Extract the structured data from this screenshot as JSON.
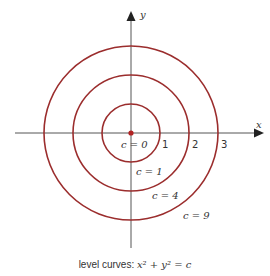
{
  "diagram": {
    "title": "level curves",
    "center": {
      "x": 131,
      "y": 133
    },
    "colors": {
      "curve": "#9b2d2d",
      "axis": "#555555",
      "text": "#333333",
      "origin_dot": "#b22222"
    },
    "axes": {
      "x_label": "x",
      "y_label": "y"
    },
    "tick_labels": [
      "1",
      "2",
      "3"
    ],
    "curves": [
      {
        "c_label": "c = 0",
        "c": 0,
        "radius_units": 0
      },
      {
        "c_label": "c = 1",
        "c": 1,
        "radius_units": 1
      },
      {
        "c_label": "c = 4",
        "c": 4,
        "radius_units": 2
      },
      {
        "c_label": "c = 9",
        "c": 9,
        "radius_units": 3
      }
    ],
    "caption": {
      "prefix": "level curves: ",
      "equation": "x² + y² = c"
    }
  }
}
